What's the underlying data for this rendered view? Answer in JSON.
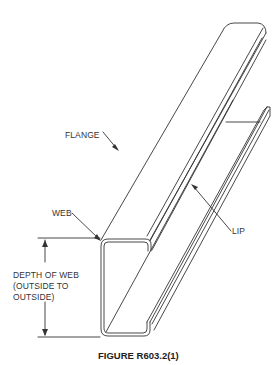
{
  "figure": {
    "caption": "FIGURE R603.2(1)",
    "line_color": "#333333",
    "background": "#ffffff"
  },
  "labels": {
    "flange": "FLANGE",
    "web": "WEB",
    "lip": "LIP",
    "depth_line1": "DEPTH OF WEB",
    "depth_line2": "(OUTSIDE TO",
    "depth_line3": "OUTSIDE)"
  }
}
